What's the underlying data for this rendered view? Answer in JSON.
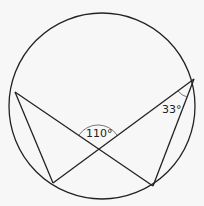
{
  "diagram": {
    "type": "circle-theorem",
    "angles": {
      "intersection": "110°",
      "inscribed": "33°"
    },
    "points": {
      "A": [
        15,
        92
      ],
      "B": [
        194,
        79
      ],
      "C": [
        53,
        183
      ],
      "D": [
        153,
        186
      ],
      "X": [
        98,
        148
      ]
    },
    "circle": {
      "cx": 102,
      "cy": 106,
      "r": 93
    },
    "colors": {
      "line": "#222222",
      "background": "#f7f7f7"
    }
  }
}
